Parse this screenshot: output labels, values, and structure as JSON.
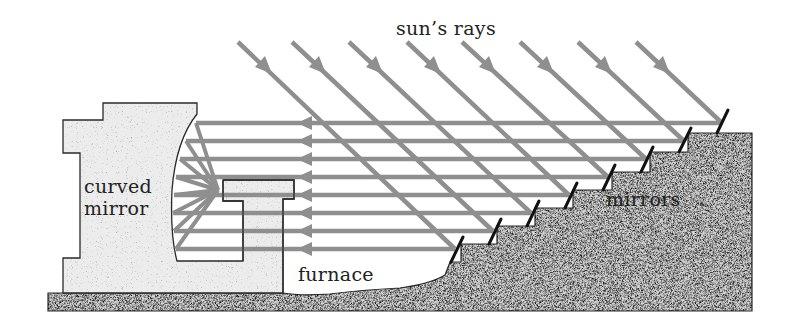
{
  "diagram": {
    "labels": {
      "sun_rays": "sun’s rays",
      "curved_mirror_line1": "curved",
      "curved_mirror_line2": "mirror",
      "furnace": "furnace",
      "mirrors": "mirrors"
    },
    "colors": {
      "ray": "#8f8f8f",
      "outline": "#2a2a2a",
      "building_fill": "#ececec",
      "ground_fill": "#bdbdbd",
      "mirror_stub": "#111111",
      "background": "#ffffff"
    },
    "incoming_rays_count": 8,
    "reflected_rays_count": 8,
    "heliostat_mirrors_count": 8
  }
}
